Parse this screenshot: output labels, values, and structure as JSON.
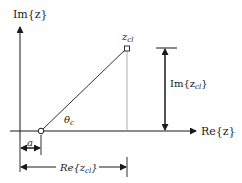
{
  "diagram": {
    "axes": {
      "y_label": "Im{z}",
      "x_label": "Re{z}"
    },
    "point": {
      "label": "z",
      "label_sub": "cl"
    },
    "angle": {
      "label": "θ",
      "label_sub": "c"
    },
    "dimensions": {
      "im_label_prefix": "Im{z",
      "im_label_sub": "cl",
      "im_label_suffix": "}",
      "a_label": "a",
      "re_label_prefix": "Re{z",
      "re_label_sub": "cl",
      "re_label_suffix": "}"
    },
    "colors": {
      "line": "#1a1a1a",
      "guide": "#9a9a9a",
      "background": "#ffffff"
    }
  }
}
